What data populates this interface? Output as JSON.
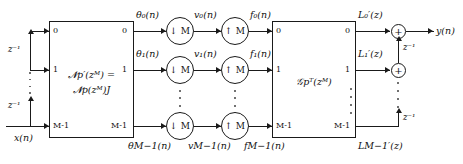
{
  "diagram": {
    "input_label": "x(n)",
    "output_label": "y(n)",
    "delay_label": "z⁻¹",
    "analysis_block": {
      "name": "analysis-polyphase-block",
      "label_line1": "𝓝p′(zᴹ) =",
      "label_line2": "𝓝p(zᴹ)J",
      "input_ports": [
        "0",
        "1",
        "M-1"
      ],
      "output_ports": [
        "0",
        "1",
        "M-1"
      ]
    },
    "synthesis_block": {
      "name": "synthesis-polyphase-block",
      "label": "𝒢pᵀ(zᴹ)",
      "input_ports": [
        "0",
        "1",
        "M-1"
      ],
      "output_ports": [
        "0",
        "1",
        "M-1"
      ]
    },
    "decimator_label": "↓ M",
    "expander_label": "↑ M",
    "adder_symbol": "+",
    "rows": [
      {
        "theta": "θ₀(n)",
        "v": "v₀(n)",
        "f": "f₀(n)",
        "L": "L₀′(z)"
      },
      {
        "theta": "θ₁(n)",
        "v": "v₁(n)",
        "f": "f₁(n)",
        "L": "L₁′(z)"
      },
      {
        "theta": "θM−1(n)",
        "v": "vM−1(n)",
        "f": "fM−1(n)",
        "L": "LM−1′(z)"
      }
    ],
    "input_delays": [
      "z⁻¹",
      "z⁻¹"
    ],
    "output_delays": [
      "z⁻¹",
      "z⁻¹"
    ],
    "colors": {
      "line": "#1a1a1a",
      "background": "#ffffff",
      "text": "#111111"
    }
  }
}
